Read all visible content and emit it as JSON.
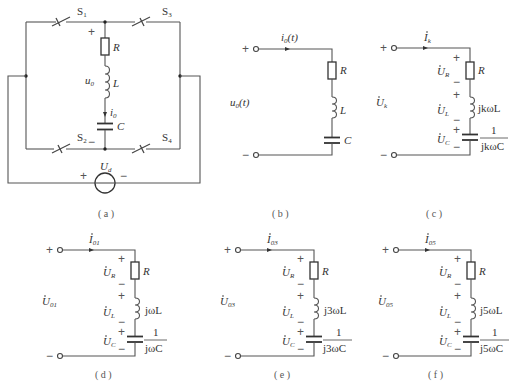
{
  "figure_a": {
    "caption": "( a )",
    "switches": [
      "S1",
      "S3",
      "S2",
      "S4"
    ],
    "switch_labels": {
      "s1": "S",
      "s1_sub": "1",
      "s3": "S",
      "s3_sub": "3",
      "s2": "S",
      "s2_sub": "2",
      "s4": "S",
      "s4_sub": "4"
    },
    "components": {
      "resistor": "R",
      "inductor": "L",
      "capacitor": "C"
    },
    "voltage": {
      "main": "u",
      "sub": "0"
    },
    "current": {
      "main": "i",
      "sub": "0"
    },
    "source": {
      "main": "U",
      "sub": "d"
    },
    "plus": "+",
    "minus": "−"
  },
  "figure_b": {
    "caption": "( b )",
    "current": {
      "main": "i",
      "sub": "0",
      "arg": "(t)"
    },
    "voltage": {
      "main": "u",
      "sub": "0",
      "arg": "(t)"
    },
    "components": {
      "resistor": "R",
      "inductor": "L",
      "capacitor": "C"
    },
    "plus": "+",
    "minus": "−"
  },
  "figure_c": {
    "caption": "( c )",
    "current": {
      "main": "I",
      "sub": "k"
    },
    "voltage": {
      "main": "U",
      "sub": "k"
    },
    "ur": {
      "main": "U",
      "sub": "R"
    },
    "ul": {
      "main": "U",
      "sub": "L"
    },
    "uc": {
      "main": "U",
      "sub": "C"
    },
    "resistor": "R",
    "inductor": "jkωL",
    "capacitor_num": "1",
    "capacitor_den": "jkωC",
    "plus": "+",
    "minus": "−"
  },
  "figure_d": {
    "caption": "( d )",
    "current": {
      "main": "I",
      "sub": "01"
    },
    "voltage": {
      "main": "U",
      "sub": "01"
    },
    "ur": {
      "main": "U",
      "sub": "R"
    },
    "ul": {
      "main": "U",
      "sub": "L"
    },
    "uc": {
      "main": "U",
      "sub": "C"
    },
    "resistor": "R",
    "inductor": "jωL",
    "capacitor_num": "1",
    "capacitor_den": "jωC",
    "plus": "+",
    "minus": "−"
  },
  "figure_e": {
    "caption": "( e )",
    "current": {
      "main": "I",
      "sub": "03"
    },
    "voltage": {
      "main": "U",
      "sub": "03"
    },
    "ur": {
      "main": "U",
      "sub": "R"
    },
    "ul": {
      "main": "U",
      "sub": "L"
    },
    "uc": {
      "main": "U",
      "sub": "C"
    },
    "resistor": "R",
    "inductor": "j3ωL",
    "capacitor_num": "1",
    "capacitor_den": "j3ωC",
    "plus": "+",
    "minus": "−"
  },
  "figure_f": {
    "caption": "( f )",
    "current": {
      "main": "I",
      "sub": "05"
    },
    "voltage": {
      "main": "U",
      "sub": "05"
    },
    "ur": {
      "main": "U",
      "sub": "R"
    },
    "ul": {
      "main": "U",
      "sub": "L"
    },
    "uc": {
      "main": "U",
      "sub": "C"
    },
    "resistor": "R",
    "inductor": "j5ωL",
    "capacitor_num": "1",
    "capacitor_den": "j5ωC",
    "plus": "+",
    "minus": "−"
  }
}
